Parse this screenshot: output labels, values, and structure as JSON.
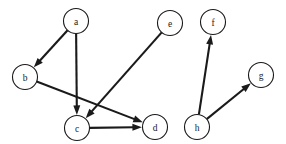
{
  "figure": {
    "kind": "directed-graph",
    "background_color": "#ffffff",
    "stroke_color": "#1a1a1a",
    "node_fill_color": "#ffffff",
    "width": 286,
    "height": 144
  },
  "graph": {
    "directed": true,
    "node_radius": 12.5,
    "nodes": [
      {
        "id": "a",
        "label": "a",
        "x": 76,
        "y": 21
      },
      {
        "id": "b",
        "label": "b",
        "x": 25,
        "y": 77
      },
      {
        "id": "c",
        "label": "c",
        "x": 77,
        "y": 128
      },
      {
        "id": "d",
        "label": "d",
        "x": 155,
        "y": 127
      },
      {
        "id": "e",
        "label": "e",
        "x": 170,
        "y": 23
      },
      {
        "id": "f",
        "label": "f",
        "x": 213,
        "y": 22
      },
      {
        "id": "g",
        "label": "g",
        "x": 261,
        "y": 75
      },
      {
        "id": "h",
        "label": "h",
        "x": 197,
        "y": 127
      }
    ],
    "edges": [
      {
        "id": "a-b",
        "from": "a",
        "to": "b"
      },
      {
        "id": "a-c",
        "from": "a",
        "to": "c"
      },
      {
        "id": "b-d",
        "from": "b",
        "to": "d"
      },
      {
        "id": "e-c",
        "from": "e",
        "to": "c"
      },
      {
        "id": "c-d",
        "from": "c",
        "to": "d"
      },
      {
        "id": "h-f",
        "from": "h",
        "to": "f"
      },
      {
        "id": "h-g",
        "from": "h",
        "to": "g"
      }
    ]
  }
}
